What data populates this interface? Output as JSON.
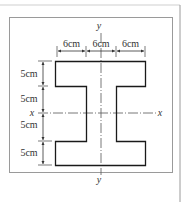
{
  "figure": {
    "type": "I-beam cross-section",
    "axes": {
      "x_label_left": "x",
      "x_label_right": "x",
      "y_label_top": "y",
      "y_label_bottom": "y"
    },
    "top_dimensions": [
      {
        "label": "6cm"
      },
      {
        "label": "6cm"
      },
      {
        "label": "6cm"
      }
    ],
    "left_dimensions": [
      {
        "label": "5cm"
      },
      {
        "label": "5cm"
      },
      {
        "label": "5cm"
      },
      {
        "label": "5cm"
      }
    ],
    "colors": {
      "shape_outline": "#1a1a1a",
      "frame": "#9a9a9a",
      "dimension_lines": "#333333",
      "axis_lines": "#555555"
    }
  }
}
